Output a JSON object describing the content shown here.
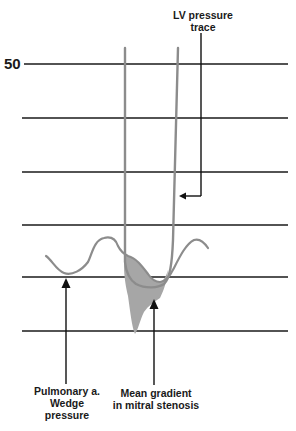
{
  "diagram": {
    "y_axis_label": "50",
    "labels": {
      "lv_line1": "LV pressure",
      "lv_line2": "trace",
      "pcwp_line1": "Pulmonary a.",
      "pcwp_line2": "Wedge",
      "pcwp_line3": "pressure",
      "gradient_line1": "Mean gradient",
      "gradient_line2": "in mitral stenosis"
    },
    "colors": {
      "grid": "#1a1a1a",
      "trace": "#8c8c8c",
      "fill": "#a6a6a6",
      "arrow": "#111111"
    },
    "grid_lines_y": [
      64,
      118,
      172,
      225,
      277,
      331
    ]
  }
}
